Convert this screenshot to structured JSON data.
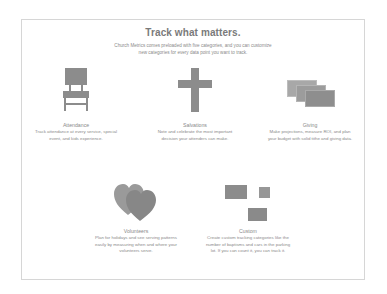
{
  "header": {
    "title": "Track what matters.",
    "subtitle_line1": "Church Metrics comes preloaded with five categories, and you can customize",
    "subtitle_line2": "new categories for every data point you want to track."
  },
  "categories": [
    {
      "name": "Attendance",
      "icon": "chair-icon",
      "desc_line1": "Track attendance at every service, special",
      "desc_line2": "event, and kids experience."
    },
    {
      "name": "Salvations",
      "icon": "cross-icon",
      "desc_line1": "Note and celebrate the most important",
      "desc_line2": "decision your attenders can make."
    },
    {
      "name": "Giving",
      "icon": "money-bills-icon",
      "desc_line1": "Make projections, measure ROI, and plan",
      "desc_line2": "your budget with solid tithe and giving data."
    },
    {
      "name": "Volunteers",
      "icon": "hearts-icon",
      "desc_line1": "Plan for holidays and see serving patterns",
      "desc_line2": "easily by measuring when and where your",
      "desc_line3": "volunteers serve."
    },
    {
      "name": "Custom",
      "icon": "custom-blocks-icon",
      "desc_line1": "Create custom tracking categories like the",
      "desc_line2": "number of baptisms and cars in the parking",
      "desc_line3": "lot. If you can count it, you can track it."
    }
  ],
  "colors": {
    "icon_gray": "#8c8c8c",
    "border": "#d6d6d6",
    "text": "#8a8a8a"
  }
}
